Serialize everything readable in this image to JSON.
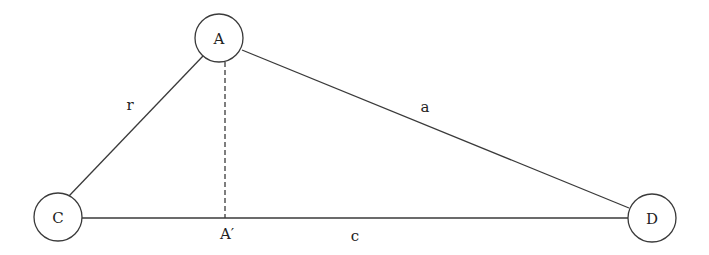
{
  "diagram": {
    "type": "triangle-graph",
    "nodes": [
      {
        "id": "A",
        "label": "A",
        "cx": 219,
        "cy": 38,
        "r": 24
      },
      {
        "id": "C",
        "label": "C",
        "cx": 58,
        "cy": 217,
        "r": 24
      },
      {
        "id": "D",
        "label": "D",
        "cx": 652,
        "cy": 218,
        "r": 24
      }
    ],
    "edges": [
      {
        "from": "C",
        "to": "A",
        "label": "r",
        "style": "solid"
      },
      {
        "from": "A",
        "to": "D",
        "label": "a",
        "style": "solid"
      },
      {
        "from": "C",
        "to": "D",
        "label": "c",
        "style": "solid"
      },
      {
        "from": "A",
        "to": "A'",
        "label": "",
        "style": "dashed"
      }
    ],
    "points": [
      {
        "id": "A'",
        "label": "A′"
      }
    ],
    "labels": {
      "node_a": "A",
      "node_c": "C",
      "node_d": "D",
      "edge_r": "r",
      "edge_a": "a",
      "edge_c": "c",
      "foot_a_prime": "A′"
    }
  }
}
